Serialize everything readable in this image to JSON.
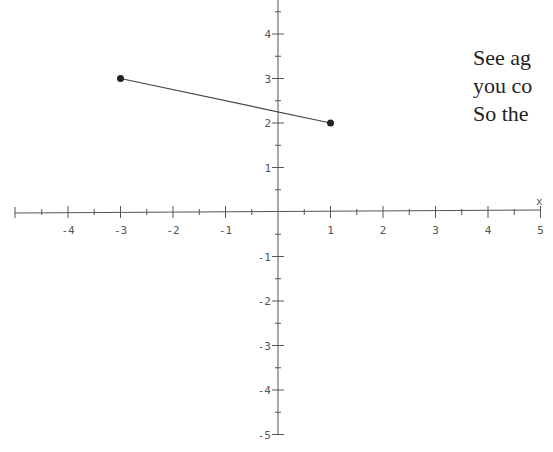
{
  "chart_data": {
    "type": "line",
    "title": "",
    "xlabel": "x",
    "ylabel": "",
    "xlim": [
      -5,
      5
    ],
    "ylim": [
      -5,
      5
    ],
    "grid": false,
    "x_ticks": [
      -4,
      -3,
      -2,
      -1,
      1,
      2,
      3,
      4,
      5
    ],
    "y_ticks": [
      -5,
      -4,
      -3,
      -2,
      -1,
      1,
      2,
      3,
      4
    ],
    "minor_ticks_step": 0.5,
    "series": [
      {
        "name": "segment",
        "points": [
          [
            -3,
            3
          ],
          [
            1,
            2
          ]
        ],
        "endpoint_markers": "filled-circle"
      }
    ]
  },
  "side_text": {
    "lines": [
      "See ag",
      "you co",
      "So the"
    ]
  },
  "colors": {
    "axis": "#555555",
    "segment": "#444444",
    "point": "#222222",
    "text": "#222222"
  }
}
